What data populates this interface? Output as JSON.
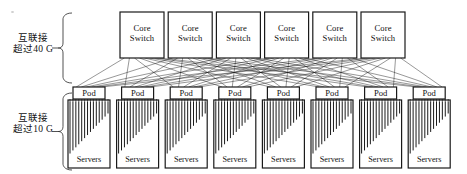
{
  "figure": {
    "type": "network-topology-diagram",
    "title": "",
    "line_color": "#1a1a1a",
    "box_fill": "#ffffff",
    "background": "#ffffff"
  },
  "tiers": [
    {
      "id": "core-tier",
      "brace_label_line1": "互联接",
      "brace_label_line2": "超过40 G",
      "speed": "40 G",
      "node_count": 6,
      "node_label_line1": "Core",
      "node_label_line2": "Switch"
    },
    {
      "id": "pod-tier",
      "brace_label_line1": "互联接",
      "brace_label_line2": "超过10 G",
      "speed": "10 G",
      "node_count": 8,
      "pod_label": "Pod",
      "servers_label": "Servers"
    }
  ],
  "core_switches": [
    {
      "label_line1": "Core",
      "label_line2": "Switch"
    },
    {
      "label_line1": "Core",
      "label_line2": "Switch"
    },
    {
      "label_line1": "Core",
      "label_line2": "Switch"
    },
    {
      "label_line1": "Core",
      "label_line2": "Switch"
    },
    {
      "label_line1": "Core",
      "label_line2": "Switch"
    },
    {
      "label_line1": "Core",
      "label_line2": "Switch"
    }
  ],
  "pods": [
    {
      "pod": "Pod",
      "servers": "Servers"
    },
    {
      "pod": "Pod",
      "servers": "Servers"
    },
    {
      "pod": "Pod",
      "servers": "Servers"
    },
    {
      "pod": "Pod",
      "servers": "Servers"
    },
    {
      "pod": "Pod",
      "servers": "Servers"
    },
    {
      "pod": "Pod",
      "servers": "Servers"
    },
    {
      "pod": "Pod",
      "servers": "Servers"
    },
    {
      "pod": "Pod",
      "servers": "Servers"
    }
  ],
  "links": {
    "description": "full mesh between core switches and pods",
    "server_lines_per_pod": 14
  }
}
